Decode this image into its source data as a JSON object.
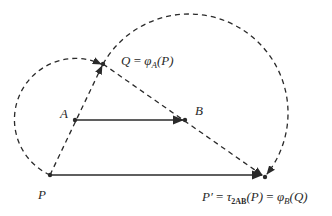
{
  "points": {
    "P": {
      "label": "P",
      "x": 50,
      "y": 175
    },
    "A": {
      "label": "A",
      "x": 75,
      "y": 120
    },
    "B": {
      "label": "B",
      "x": 185,
      "y": 120
    },
    "Q": {
      "label": "Q",
      "x": 103,
      "y": 64
    },
    "Pprime": {
      "label": "P′",
      "x": 265,
      "y": 177
    }
  },
  "labels": {
    "Q_eq": {
      "lhs": "Q",
      "eq": " = ",
      "phi": "φ",
      "sub": "A",
      "arg": "(P)"
    },
    "Pprime_eq": {
      "lhs": "P′",
      "eq1": " = ",
      "tau": "τ",
      "tau_sub": "2AB",
      "tau_arg": "(P)",
      "eq2": " = ",
      "phi": "φ",
      "phi_sub": "B",
      "phi_arg": "(Q)"
    },
    "A": "A",
    "B": "B",
    "P": "P"
  },
  "colors": {
    "stroke": "#2a2a2a",
    "background": "#ffffff"
  }
}
